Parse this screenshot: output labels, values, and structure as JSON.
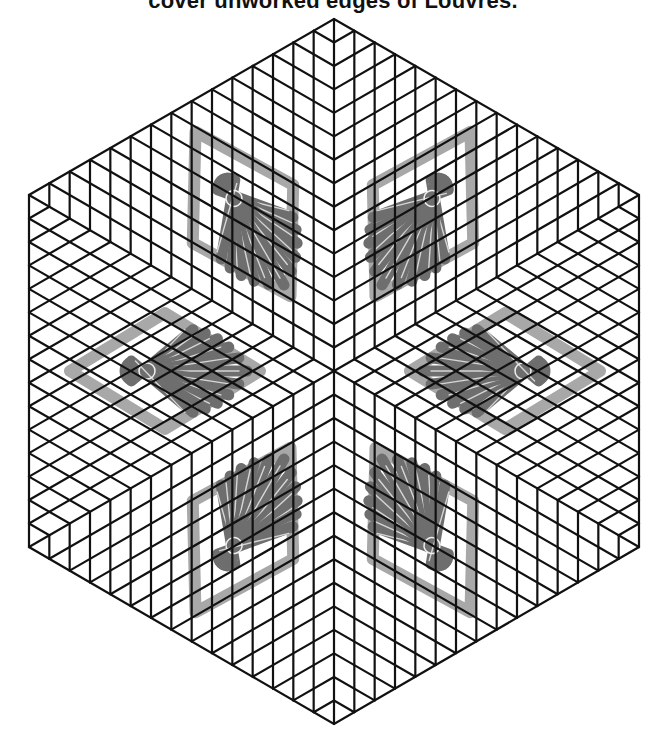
{
  "caption": {
    "text": "cover unworked edges of Louvres."
  },
  "figure": {
    "shape": "hexagon-tumbling-blocks",
    "center": [
      334,
      371
    ],
    "vertices": [
      [
        334,
        19
      ],
      [
        639,
        195
      ],
      [
        639,
        547
      ],
      [
        334,
        724
      ],
      [
        29,
        547
      ],
      [
        29,
        195
      ]
    ],
    "divisions_per_side": 15,
    "line_color": "#111111",
    "line_width": 2.2
  },
  "louvres": {
    "count": 6,
    "frame_color": "#a8a8a8",
    "rod_color": "#6e6e6e",
    "highlight_color": "#f0f0f0",
    "items": [
      {
        "name": "louvre-upper-left",
        "center": [
          243,
          214
        ],
        "angle": -120
      },
      {
        "name": "louvre-upper-right",
        "center": [
          423,
          214
        ],
        "angle": -60
      },
      {
        "name": "louvre-left",
        "center": [
          165,
          371
        ],
        "angle": 180
      },
      {
        "name": "louvre-right",
        "center": [
          505,
          371
        ],
        "angle": 0
      },
      {
        "name": "louvre-lower-left",
        "center": [
          243,
          530
        ],
        "angle": 120
      },
      {
        "name": "louvre-lower-right",
        "center": [
          423,
          530
        ],
        "angle": 60
      }
    ]
  }
}
